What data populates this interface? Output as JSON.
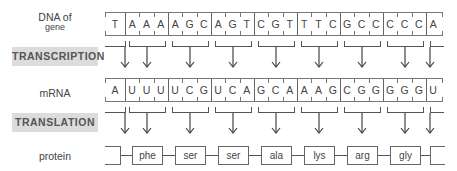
{
  "labels": {
    "dna": "DNA of",
    "dna_sub": "gene",
    "transcription": "TRANSCRIPTION",
    "mrna": "mRNA",
    "translation": "TRANSLATION",
    "protein": "protein"
  },
  "dna_bases": [
    "T",
    "A",
    "A",
    "A",
    "A",
    "G",
    "C",
    "A",
    "G",
    "T",
    "C",
    "G",
    "T",
    "T",
    "T",
    "C",
    "G",
    "C",
    "C",
    "C",
    "C",
    "C",
    "A"
  ],
  "mrna_bases": [
    "A",
    "U",
    "U",
    "U",
    "U",
    "C",
    "G",
    "U",
    "C",
    "A",
    "G",
    "C",
    "A",
    "A",
    "A",
    "G",
    "C",
    "G",
    "G",
    "G",
    "G",
    "G",
    "U"
  ],
  "amino_acids": [
    "phe",
    "ser",
    "ser",
    "ala",
    "lys",
    "arg",
    "gly"
  ],
  "colors": {
    "label_bg": "#dcdcdc",
    "line": "#666666",
    "text": "#444444"
  }
}
